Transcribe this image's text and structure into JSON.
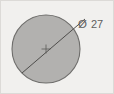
{
  "drawing": {
    "title": "circle-diameter-dimension",
    "background_color": "#f1f0ee",
    "border_color": "#dcdad7",
    "circle": {
      "name": "circle-shape",
      "fill_color": "#b2b1af",
      "stroke_color": "#6e6d6b",
      "center_x": 45,
      "center_y": 48,
      "radius": 34,
      "diameter_value": 27
    },
    "center_mark": {
      "name": "center-mark",
      "color": "#5b5a58",
      "size": 5
    },
    "dimension_line": {
      "name": "diameter-leader-line",
      "color": "#4e4d4b",
      "x1": 21,
      "y1": 72,
      "x2": 84,
      "y2": 18
    },
    "label": {
      "symbol": "Ø",
      "value": "27",
      "full_text": "Ø 27",
      "color": "#5f5f5f"
    }
  }
}
